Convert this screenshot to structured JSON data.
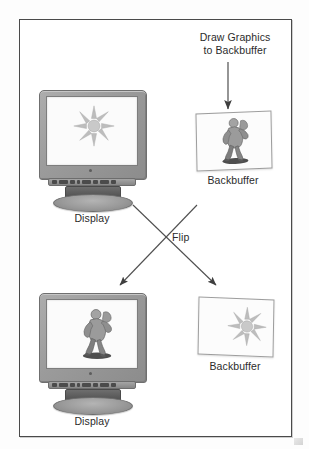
{
  "diagram": {
    "title_arrow_label": "Draw Graphics\nto Backbuffer",
    "title_line1": "Draw Graphics",
    "title_line2": "to Backbuffer",
    "flip_label": "Flip",
    "nodes": {
      "display_top": {
        "label": "Display",
        "screen_content": "sun"
      },
      "backbuffer_top": {
        "label": "Backbuffer",
        "screen_content": "character"
      },
      "display_bottom": {
        "label": "Display",
        "screen_content": "character"
      },
      "backbuffer_bottom": {
        "label": "Backbuffer",
        "screen_content": "sun"
      }
    },
    "colors": {
      "border": "#4a4a4a",
      "bezel": "#9b9b9b",
      "screen": "#fbfbfb",
      "text": "#2b2b2b",
      "arrow": "#4f4f4f",
      "sun": "#b9b9b9",
      "figure": "#8d8d8d"
    }
  }
}
